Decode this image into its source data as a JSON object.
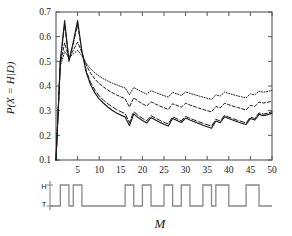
{
  "figure": {
    "background": "#ffffff",
    "axis_color": "#555555",
    "curve_color": "#1a1a1a"
  },
  "chart_data": {
    "type": "line",
    "title": "",
    "xlabel": "M",
    "ylabel": "P(X = H|D)",
    "xlim": [
      0,
      50
    ],
    "ylim": [
      0.1,
      0.7
    ],
    "grid": false,
    "legend": "none",
    "xticks": [
      5,
      10,
      15,
      20,
      25,
      30,
      35,
      40,
      45,
      50
    ],
    "yticks": [
      "0.1",
      "0.2",
      "0.3",
      "0.4",
      "0.5",
      "0.6",
      "0.7"
    ],
    "x": [
      0,
      1,
      2,
      3,
      4,
      5,
      6,
      7,
      8,
      9,
      10,
      11,
      12,
      13,
      14,
      15,
      16,
      17,
      18,
      19,
      20,
      21,
      22,
      23,
      24,
      25,
      26,
      27,
      28,
      29,
      30,
      31,
      32,
      33,
      34,
      35,
      36,
      37,
      38,
      39,
      40,
      41,
      42,
      43,
      44,
      45,
      46,
      47,
      48,
      49,
      50
    ],
    "series": [
      {
        "name": "solid",
        "style": "solid",
        "values": [
          0.1,
          0.5,
          0.665,
          0.5,
          0.578,
          0.665,
          0.54,
          0.455,
          0.405,
          0.372,
          0.348,
          0.33,
          0.315,
          0.302,
          0.291,
          0.282,
          0.274,
          0.24,
          0.287,
          0.272,
          0.26,
          0.25,
          0.272,
          0.262,
          0.253,
          0.245,
          0.238,
          0.268,
          0.26,
          0.252,
          0.27,
          0.262,
          0.255,
          0.248,
          0.241,
          0.235,
          0.229,
          0.258,
          0.251,
          0.275,
          0.268,
          0.261,
          0.255,
          0.249,
          0.244,
          0.268,
          0.262,
          0.285,
          0.28,
          0.284,
          0.29
        ]
      },
      {
        "name": "long-dash",
        "style": "longdash",
        "values": [
          0.1,
          0.5,
          0.65,
          0.505,
          0.572,
          0.65,
          0.54,
          0.462,
          0.415,
          0.383,
          0.36,
          0.342,
          0.328,
          0.316,
          0.305,
          0.296,
          0.288,
          0.252,
          0.296,
          0.281,
          0.269,
          0.259,
          0.28,
          0.27,
          0.261,
          0.253,
          0.246,
          0.275,
          0.267,
          0.259,
          0.277,
          0.269,
          0.262,
          0.255,
          0.249,
          0.243,
          0.237,
          0.265,
          0.258,
          0.281,
          0.274,
          0.267,
          0.261,
          0.256,
          0.25,
          0.274,
          0.268,
          0.291,
          0.286,
          0.29,
          0.296
        ]
      },
      {
        "name": "dashed",
        "style": "dashed",
        "values": [
          0.1,
          0.49,
          0.575,
          0.512,
          0.545,
          0.578,
          0.535,
          0.485,
          0.452,
          0.428,
          0.41,
          0.396,
          0.384,
          0.373,
          0.364,
          0.356,
          0.348,
          0.315,
          0.352,
          0.339,
          0.328,
          0.319,
          0.336,
          0.327,
          0.319,
          0.312,
          0.305,
          0.328,
          0.321,
          0.314,
          0.33,
          0.323,
          0.317,
          0.311,
          0.305,
          0.3,
          0.295,
          0.317,
          0.311,
          0.33,
          0.324,
          0.318,
          0.313,
          0.308,
          0.303,
          0.322,
          0.317,
          0.335,
          0.331,
          0.334,
          0.339
        ]
      },
      {
        "name": "dotted",
        "style": "dotted",
        "values": [
          0.1,
          0.48,
          0.54,
          0.515,
          0.53,
          0.545,
          0.522,
          0.492,
          0.47,
          0.453,
          0.44,
          0.429,
          0.42,
          0.412,
          0.405,
          0.398,
          0.392,
          0.365,
          0.394,
          0.384,
          0.375,
          0.367,
          0.381,
          0.374,
          0.367,
          0.361,
          0.355,
          0.374,
          0.368,
          0.362,
          0.376,
          0.37,
          0.365,
          0.36,
          0.355,
          0.35,
          0.346,
          0.364,
          0.359,
          0.375,
          0.37,
          0.365,
          0.36,
          0.356,
          0.352,
          0.368,
          0.364,
          0.379,
          0.375,
          0.378,
          0.382
        ]
      }
    ]
  },
  "sequence_panel": {
    "label_high": "H",
    "label_low": "T",
    "xlabel": "M",
    "values": [
      0,
      1,
      1,
      0,
      1,
      1,
      0,
      0,
      0,
      0,
      0,
      0,
      0,
      0,
      0,
      0,
      1,
      1,
      0,
      0,
      1,
      1,
      0,
      0,
      0,
      1,
      1,
      0,
      0,
      1,
      1,
      0,
      0,
      0,
      1,
      1,
      0,
      1,
      1,
      1,
      0,
      0,
      0,
      0,
      1,
      1,
      1,
      0,
      0,
      0
    ]
  }
}
